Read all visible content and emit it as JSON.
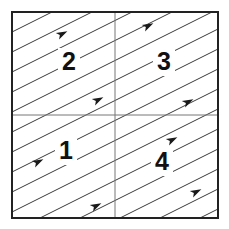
{
  "figure": {
    "background_color": "#ffffff",
    "canvas": {
      "width": 229,
      "height": 229
    }
  },
  "square": {
    "name": "outer-square",
    "x": 12,
    "y": 12,
    "width": 206,
    "height": 206,
    "border_color": "#222222",
    "border_width": 2,
    "fill_color": "#ffffff"
  },
  "dividers": {
    "color": "#777777",
    "width": 1,
    "vertical_x": 115,
    "horizontal_y": 115
  },
  "vector_field": {
    "name": "diagonal-streamlines",
    "line_color": "#3a3a3a",
    "line_width": 1,
    "slope": 0.5,
    "angle_degrees": 27,
    "direction": "up-right",
    "vertical_spacing": 20,
    "line_count": 21,
    "arrow_color": "#1a1a1a",
    "arrow_size": 6,
    "arrow_count": 8,
    "arrow_positions": [
      {
        "x": 62,
        "y": 34
      },
      {
        "x": 98,
        "y": 100
      },
      {
        "x": 148,
        "y": 26
      },
      {
        "x": 188,
        "y": 102
      },
      {
        "x": 38,
        "y": 162
      },
      {
        "x": 96,
        "y": 206
      },
      {
        "x": 172,
        "y": 140
      },
      {
        "x": 196,
        "y": 192
      }
    ]
  },
  "quadrants": [
    {
      "id": "upper-left",
      "label": "2",
      "label_x": 58,
      "label_y": 48
    },
    {
      "id": "upper-right",
      "label": "3",
      "label_x": 153,
      "label_y": 48
    },
    {
      "id": "lower-left",
      "label": "1",
      "label_x": 55,
      "label_y": 137
    },
    {
      "id": "lower-right",
      "label": "4",
      "label_x": 151,
      "label_y": 148
    }
  ]
}
